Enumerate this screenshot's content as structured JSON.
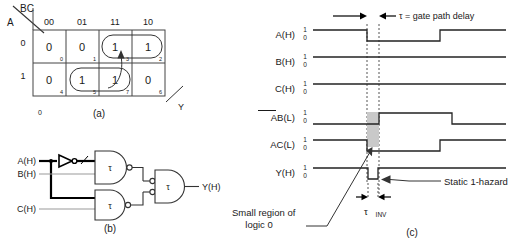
{
  "figure": {
    "panels": [
      {
        "id": "a",
        "label": "(a)",
        "caption": "Karnaugh map"
      },
      {
        "id": "b",
        "label": "(b)",
        "caption": "Logic circuit"
      },
      {
        "id": "c",
        "label": "(c)",
        "caption": "Timing diagram"
      }
    ]
  },
  "kmap": {
    "corner_top_label": "BC",
    "corner_left_label": "A",
    "col_headers": [
      "00",
      "01",
      "11",
      "10"
    ],
    "row_headers": [
      "0",
      "1"
    ],
    "cells": [
      {
        "value": "0",
        "index": "0"
      },
      {
        "value": "0",
        "index": "1"
      },
      {
        "value": "1",
        "index": "3"
      },
      {
        "value": "1",
        "index": "2"
      },
      {
        "value": "0",
        "index": "4"
      },
      {
        "value": "1",
        "index": "5"
      },
      {
        "value": "1",
        "index": "7"
      },
      {
        "value": "0",
        "index": "6"
      }
    ],
    "output_label": "Y",
    "stray_zero": "0",
    "panel_label": "(a)"
  },
  "circuit": {
    "inputs": [
      "A(H)",
      "B(H)",
      "C(H)"
    ],
    "output": "Y(H)",
    "gate_label": "τ",
    "gates": [
      {
        "name": "nand-ab-bar",
        "label": "τ"
      },
      {
        "name": "nand-ac",
        "label": "τ"
      },
      {
        "name": "nand-output",
        "label": "τ"
      }
    ],
    "panel_label": "(b)"
  },
  "timing": {
    "delay_note": "τ = gate path delay",
    "level_high": "1",
    "level_low": "0",
    "signals": [
      {
        "name": "A(H)",
        "overbar": false
      },
      {
        "name": "B(H)",
        "overbar": false
      },
      {
        "name": "C(H)",
        "overbar": false
      },
      {
        "name": "AB(L)",
        "overbar": true,
        "overbar_text": "AB"
      },
      {
        "name": "AC(L)",
        "overbar": false
      },
      {
        "name": "Y(H)",
        "overbar": false
      }
    ],
    "annotations": {
      "hazard": "Static 1-hazard",
      "small_region_line1": "Small region of",
      "small_region_line2": "logic 0",
      "tau_inv": "τ",
      "tau_inv_sub": "INV"
    },
    "panel_label": "(c)"
  }
}
